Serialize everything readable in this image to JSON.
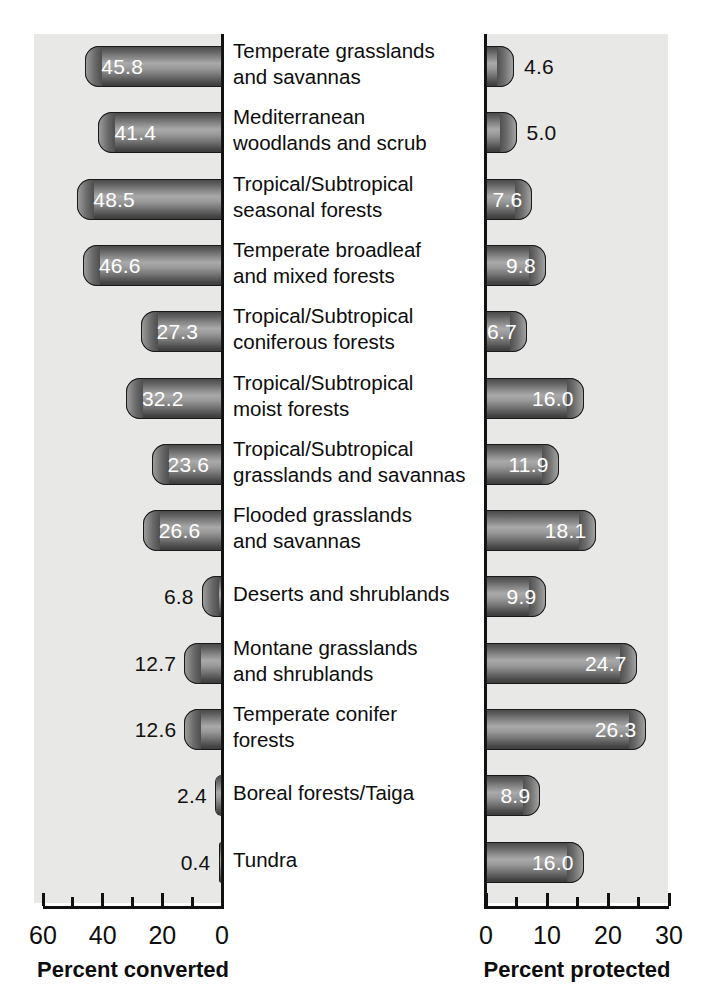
{
  "chart_data": {
    "type": "bar",
    "title": "",
    "orientation": "horizontal",
    "layout": "two-panel back-to-back horizontal bar chart with shared category labels in the center",
    "categories": [
      "Temperate grasslands and savannas",
      "Mediterranean woodlands and scrub",
      "Tropical/Subtropical seasonal forests",
      "Temperate broadleaf and mixed forests",
      "Tropical/Subtropical coniferous forests",
      "Tropical/Subtropical moist forests",
      "Tropical/Subtropical grasslands and savannas",
      "Flooded grasslands and savannas",
      "Deserts and shrublands",
      "Montane grasslands and shrublands",
      "Temperate conifer forests",
      "Boreal forests/Taiga",
      "Tundra"
    ],
    "category_lines": [
      [
        "Temperate grasslands",
        "and savannas"
      ],
      [
        "Mediterranean",
        "woodlands and scrub"
      ],
      [
        "Tropical/Subtropical",
        "seasonal forests"
      ],
      [
        "Temperate broadleaf",
        "and mixed forests"
      ],
      [
        "Tropical/Subtropical",
        "coniferous forests"
      ],
      [
        "Tropical/Subtropical",
        "moist forests"
      ],
      [
        "Tropical/Subtropical",
        "grasslands and savannas"
      ],
      [
        "Flooded grasslands",
        "and savannas"
      ],
      [
        "Deserts and shrublands",
        ""
      ],
      [
        "Montane grasslands",
        "and shrublands"
      ],
      [
        "Temperate conifer",
        "forests"
      ],
      [
        "Boreal forests/Taiga",
        ""
      ],
      [
        "Tundra",
        ""
      ]
    ],
    "series": [
      {
        "name": "Percent converted",
        "panel": "left",
        "direction": "right-to-left",
        "axis": {
          "label": "Percent converted",
          "ticks": [
            60,
            40,
            20,
            0
          ],
          "tick_labels": [
            "60",
            "40",
            "20",
            "0"
          ],
          "minor_ticks": [
            50,
            30,
            10
          ],
          "min": 0,
          "max": 60,
          "reversed": true
        },
        "values": [
          45.8,
          41.4,
          48.5,
          46.6,
          27.3,
          32.2,
          23.6,
          26.6,
          6.8,
          12.7,
          12.6,
          2.4,
          0.4
        ],
        "value_labels": [
          "45.8",
          "41.4",
          "48.5",
          "46.6",
          "27.3",
          "32.2",
          "23.6",
          "26.6",
          "6.8",
          "12.7",
          "12.6",
          "2.4",
          "0.4"
        ],
        "label_placement": [
          "inside",
          "inside",
          "inside",
          "inside",
          "inside",
          "inside",
          "inside",
          "inside",
          "outside",
          "outside",
          "outside",
          "outside",
          "outside"
        ]
      },
      {
        "name": "Percent protected",
        "panel": "right",
        "direction": "left-to-right",
        "axis": {
          "label": "Percent protected",
          "ticks": [
            0,
            10,
            20,
            30
          ],
          "tick_labels": [
            "0",
            "10",
            "20",
            "30"
          ],
          "minor_ticks": [
            5,
            15,
            25
          ],
          "min": 0,
          "max": 30,
          "reversed": false
        },
        "values": [
          4.6,
          5.0,
          7.6,
          9.8,
          6.7,
          16.0,
          11.9,
          18.1,
          9.9,
          24.7,
          26.3,
          8.9,
          16.0
        ],
        "value_labels": [
          "4.6",
          "5.0",
          "7.6",
          "9.8",
          "6.7",
          "16.0",
          "11.9",
          "18.1",
          "9.9",
          "24.7",
          "26.3",
          "8.9",
          "16.0"
        ],
        "label_placement": [
          "outside",
          "outside",
          "inside",
          "inside",
          "inside",
          "inside",
          "inside",
          "inside",
          "inside",
          "inside",
          "inside",
          "inside",
          "inside"
        ]
      }
    ],
    "grid": false,
    "legend": null,
    "colors": {
      "panel_background": "#e8e8e6",
      "page_background": "#ffffff",
      "bar_dark": "#3c3c3c",
      "bar_light": "#a9a9a9",
      "bar_outline": "#1a1a1a",
      "text": "#0d0d0d",
      "inside_label": "#ffffff"
    }
  }
}
